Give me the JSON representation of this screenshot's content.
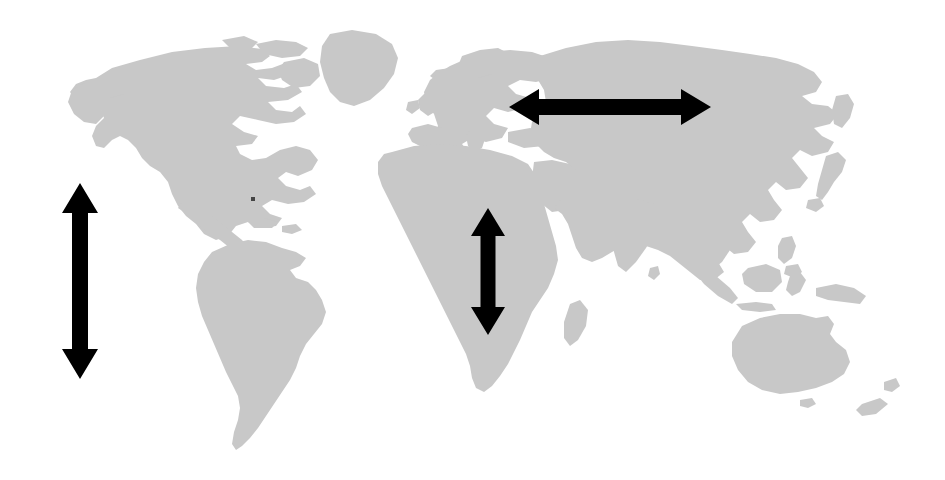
{
  "figure": {
    "type": "annotated-world-map",
    "canvas_width": 945,
    "canvas_height": 480,
    "background_color": "#ffffff",
    "land_color": "#c8c8c8",
    "arrow_color": "#000000",
    "projection": "equirectangular-style world outline",
    "visible_text": []
  },
  "map": {
    "name": "world-map",
    "land_color": "#c8c8c8",
    "ocean_color": "#ffffff",
    "landmasses": [
      {
        "name": "north-america",
        "bbox": [
          70,
          45,
          330,
          250
        ]
      },
      {
        "name": "greenland",
        "bbox": [
          300,
          30,
          400,
          120
        ]
      },
      {
        "name": "south-america",
        "bbox": [
          195,
          240,
          330,
          455
        ]
      },
      {
        "name": "europe",
        "bbox": [
          420,
          55,
          580,
          175
        ]
      },
      {
        "name": "africa",
        "bbox": [
          375,
          145,
          565,
          395
        ]
      },
      {
        "name": "asia",
        "bbox": [
          540,
          45,
          860,
          300
        ]
      },
      {
        "name": "australia",
        "bbox": [
          725,
          310,
          855,
          405
        ]
      },
      {
        "name": "new-zealand",
        "bbox": [
          855,
          380,
          900,
          425
        ]
      },
      {
        "name": "madagascar",
        "bbox": [
          565,
          300,
          590,
          350
        ]
      },
      {
        "name": "japan",
        "bbox": [
          820,
          155,
          860,
          215
        ]
      },
      {
        "name": "indonesia",
        "bbox": [
          700,
          265,
          810,
          310
        ]
      },
      {
        "name": "british-isles",
        "bbox": [
          410,
          90,
          450,
          125
        ]
      }
    ]
  },
  "arrows": [
    {
      "name": "americas-vertical-arrow",
      "orientation": "vertical",
      "style": "double-headed",
      "color": "#000000",
      "center_x": 80,
      "top_y": 183,
      "bottom_y": 379,
      "length_px": 196,
      "shaft_width_px": 16,
      "head_width_px": 36,
      "head_length_px": 30,
      "meaning": "north-south extent across the Americas"
    },
    {
      "name": "eurasia-horizontal-arrow",
      "orientation": "horizontal",
      "style": "double-headed",
      "color": "#000000",
      "center_y": 107,
      "left_x": 509,
      "right_x": 711,
      "length_px": 202,
      "shaft_width_px": 16,
      "head_width_px": 36,
      "head_length_px": 30,
      "meaning": "east-west extent across Eurasia"
    },
    {
      "name": "africa-vertical-arrow",
      "orientation": "vertical",
      "style": "double-headed",
      "color": "#000000",
      "center_x": 488,
      "top_y": 208,
      "bottom_y": 335,
      "length_px": 127,
      "shaft_width_px": 15,
      "head_width_px": 34,
      "head_length_px": 28,
      "meaning": "north-south extent across Africa"
    }
  ]
}
